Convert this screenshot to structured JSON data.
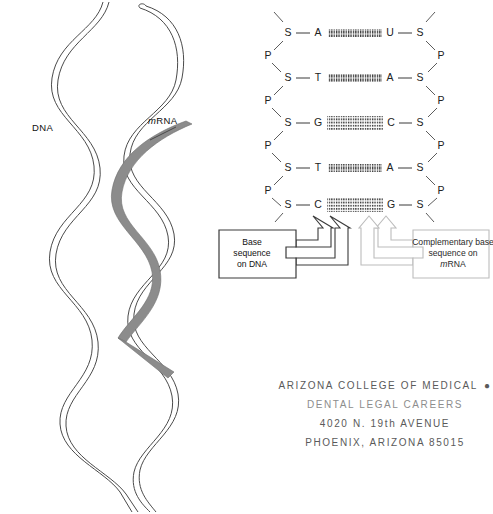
{
  "figure": {
    "helix": {
      "dna_label": "DNA",
      "mrna_label_prefix": "m",
      "mrna_label_rest": "RNA",
      "strand_color": "#4a4a4a",
      "mrna_color": "#8c8c8c"
    },
    "ladder": {
      "sugar_symbol": "S",
      "phosphate_symbol": "P",
      "rungs": [
        {
          "left_base": "A",
          "right_base": "U",
          "bond": "double"
        },
        {
          "left_base": "T",
          "right_base": "A",
          "bond": "double"
        },
        {
          "left_base": "G",
          "right_base": "C",
          "bond": "triple"
        },
        {
          "left_base": "T",
          "right_base": "A",
          "bond": "double"
        },
        {
          "left_base": "C",
          "right_base": "G",
          "bond": "triple"
        }
      ]
    },
    "callouts": [
      {
        "id": "dna-callout",
        "lines": [
          "Base",
          "sequence",
          "on DNA"
        ],
        "color": "#3a3a3a"
      },
      {
        "id": "mrna-callout",
        "line1": "Complementary base",
        "line2": "sequence on",
        "line3_prefix": "m",
        "line3_rest": "RNA",
        "color": "#b9b9b9"
      }
    ]
  },
  "stamp": {
    "lines": [
      "ARIZONA COLLEGE OF MEDICAL",
      "DENTAL    LEGAL CAREERS",
      "4020 N. 19th AVENUE",
      "PHOENIX, ARIZONA   85015"
    ],
    "bullet": "●",
    "color": "#6b6b6b"
  }
}
